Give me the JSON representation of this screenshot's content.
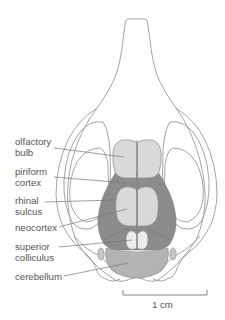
{
  "figure": {
    "colors": {
      "outline": "#9a9a9a",
      "light_region": "#d9d9d9",
      "dark_region": "#8c8c8c",
      "medium_region": "#b3b3b3",
      "colliculus": "#ececec",
      "label_text": "#555555",
      "leader_line": "#777777"
    }
  },
  "labels": [
    {
      "id": "olfactory-bulb",
      "text": "olfactory\nbulb"
    },
    {
      "id": "piriform-cortex",
      "text": "piriform\ncortex"
    },
    {
      "id": "rhinal-sulcus",
      "text": "rhinal\nsulcus"
    },
    {
      "id": "neocortex",
      "text": "neocortex"
    },
    {
      "id": "superior-colliculus",
      "text": "superior\ncolliculus"
    },
    {
      "id": "cerebellum",
      "text": "cerebellum"
    }
  ],
  "scale_bar": {
    "label": "1 cm"
  }
}
